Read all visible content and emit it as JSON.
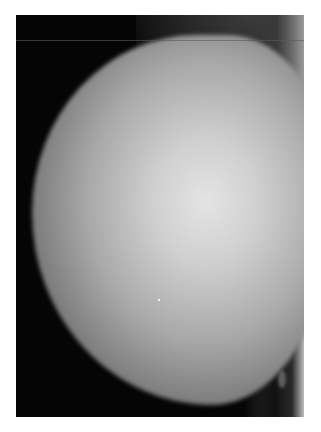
{
  "image": {
    "description": "Grayscale mammogram-style radiograph on a white page",
    "colors": {
      "page_background": "#ffffff",
      "image_background": "#050505",
      "tissue_highlight": "#e4e4e4",
      "tissue_mid": "#a9a9a9",
      "tissue_edge": "#555555"
    }
  }
}
